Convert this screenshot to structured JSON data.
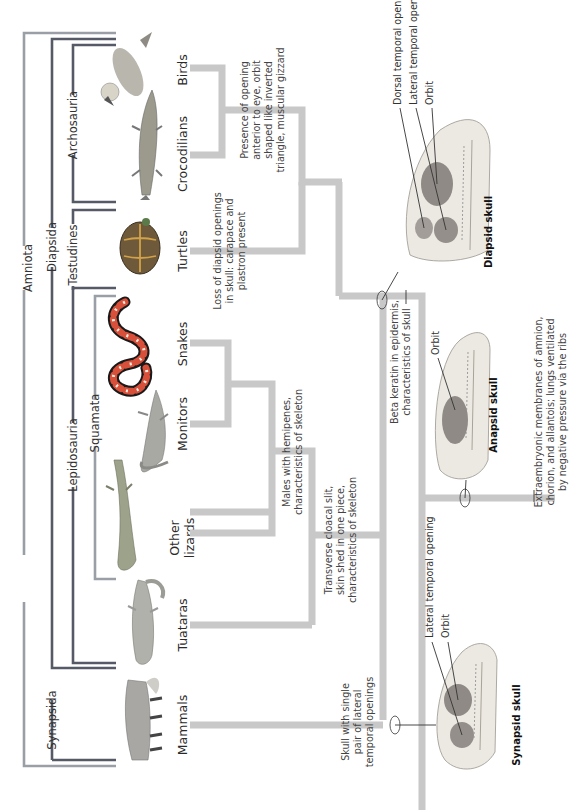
{
  "figure": {
    "orientation": "rotated-90-ccw",
    "colors": {
      "branch": "#c8c8c8",
      "bracket_dark": "#555a66",
      "bracket_light": "#9a9ea6",
      "text": "#333333",
      "skull_fill": "#ece9e2",
      "opening_fill": "#8f8a86"
    }
  },
  "clades": {
    "amniota": "Amniota",
    "synapsida": "Synapsida",
    "diapsida": "Diapsida",
    "lepidosauria": "Lepidosauria",
    "squamata": "Squamata",
    "testudines": "Testudines",
    "archosauria": "Archosauria"
  },
  "taxa": {
    "birds": "Birds",
    "crocodilians": "Crocodilians",
    "turtles": "Turtles",
    "snakes": "Snakes",
    "monitors": "Monitors",
    "other_lizards_line1": "Other",
    "other_lizards_line2": "lizards",
    "tuataras": "Tuataras",
    "mammals": "Mammals"
  },
  "characters": {
    "archosaur": [
      "Presence of opening",
      "anterior to eye, orbit",
      "shaped like inverted",
      "triangle, muscular gizzard"
    ],
    "turtle": [
      "Loss of diapsid openings",
      "in skull: carapace and",
      "plastron present"
    ],
    "squamate": [
      "Males with hemipenes,",
      "characteristics of skeleton"
    ],
    "lepidosaur": [
      "Transverse cloacal slit,",
      "skin shed in one piece,",
      "characteristics of skeleton"
    ],
    "reptile": [
      "Beta keratin in epidermis,",
      "characteristics of skull"
    ],
    "amniote": [
      "Extraembryonic membranes of amnion,",
      "chorion, and allantois; lungs ventilated",
      "by negative pressure via the ribs"
    ],
    "synapsid": [
      "Skull with single",
      "pair of lateral",
      "temporal openings"
    ]
  },
  "skulls": {
    "diapsid": {
      "title": "Diapsid skull",
      "labels": [
        "Dorsal temporal opening",
        "Lateral temporal opening",
        "Orbit"
      ]
    },
    "anapsid": {
      "title": "Anapsid skull",
      "labels": [
        "Orbit"
      ]
    },
    "synapsid": {
      "title": "Synapsid skull",
      "labels": [
        "Lateral temporal opening",
        "Orbit"
      ]
    }
  }
}
